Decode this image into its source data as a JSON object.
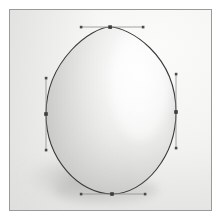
{
  "image": {
    "title": "Egg with vector bezier path overlay",
    "subject": "egg",
    "width": 222,
    "height": 221,
    "background_color": "#f2f2f0",
    "frame_border_color": "#9a9a9a",
    "outer_margin_color": "#ffffff"
  },
  "egg": {
    "label": "egg",
    "outline_color": "#3a3a3a",
    "outline_width": 1.1,
    "body_light_color": "#fdfdfc",
    "body_mid_color": "#e3e3e1",
    "body_shade_color": "#c9c9c7",
    "highlight_position": "upper-right",
    "shadow_color": "#c2c2c0",
    "shadow_position": "lower-left"
  },
  "path_overlay": {
    "label": "bezier path",
    "anchor_color": "#3c3c3c",
    "handle_line_color": "#8e8e8e",
    "handle_point_color": "#4a4a4a",
    "anchor_size": 3.4,
    "handle_size": 2.4,
    "anchors": [
      {
        "name": "top-anchor",
        "x": 110,
        "y": 27,
        "handle_in": {
          "x": 81,
          "y": 27
        },
        "handle_out": {
          "x": 143,
          "y": 27
        }
      },
      {
        "name": "right-anchor",
        "x": 176,
        "y": 112,
        "handle_in": {
          "x": 176,
          "y": 74
        },
        "handle_out": {
          "x": 176,
          "y": 148
        }
      },
      {
        "name": "bottom-anchor",
        "x": 112,
        "y": 194,
        "handle_in": {
          "x": 145,
          "y": 194
        },
        "handle_out": {
          "x": 81,
          "y": 194
        }
      },
      {
        "name": "left-anchor",
        "x": 46,
        "y": 114,
        "handle_in": {
          "x": 46,
          "y": 150
        },
        "handle_out": {
          "x": 46,
          "y": 78
        }
      }
    ]
  }
}
